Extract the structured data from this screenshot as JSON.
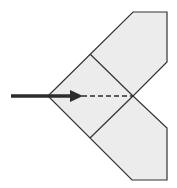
{
  "diagram": {
    "type": "fold-instruction",
    "colors": {
      "paper_fill": "#ececec",
      "stroke": "#333333",
      "arrow": "#2b2b2b",
      "background": "#ffffff"
    },
    "shape": {
      "outline_points": "48,96 133,12 167,12 167,62 133,96 167,128 167,180 132,180",
      "crease_top": {
        "x1": 90,
        "y1": 54,
        "x2": 133,
        "y2": 96
      },
      "crease_bottom": {
        "x1": 90,
        "y1": 138,
        "x2": 133,
        "y2": 96
      }
    },
    "arrow": {
      "x1": 11,
      "y1": 96,
      "x2": 70,
      "y2": 96,
      "dashed_to_x": 133
    }
  }
}
